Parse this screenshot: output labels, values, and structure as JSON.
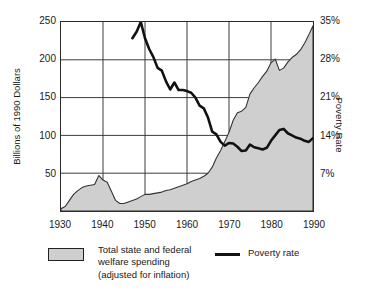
{
  "figure": {
    "cropped_header_remnant": "",
    "left_axis_title": "Billions of 1990 Dollars",
    "right_axis_title": "Poverty Rate"
  },
  "legend": {
    "area_label": "Total state and federal\nwelfare spending\n(adjusted for inflation)",
    "line_label": "Poverty rate",
    "area_color": "#cfcfcf",
    "line_color": "#111111"
  },
  "chart_data": {
    "type": "area",
    "title": "",
    "xlabel": "",
    "ylabel": "Billions of 1990 Dollars",
    "y2label": "Poverty Rate",
    "grid": true,
    "legend_position": "bottom",
    "xlim": [
      1930,
      1990
    ],
    "xticks": [
      1930,
      1940,
      1950,
      1960,
      1970,
      1980,
      1990
    ],
    "xticklabels": [
      "1930",
      "1940",
      "1950",
      "1960",
      "1970",
      "1980",
      "1990"
    ],
    "ylim": [
      0,
      250
    ],
    "yticks": [
      50,
      100,
      150,
      200,
      250
    ],
    "yticklabels": [
      "50",
      "100",
      "150",
      "200",
      "250"
    ],
    "y2lim": [
      0,
      35
    ],
    "y2ticks": [
      7,
      14,
      21,
      28,
      35
    ],
    "y2ticklabels": [
      "7%",
      "14%",
      "21%",
      "28%",
      "35%"
    ],
    "series": [
      {
        "name": "Total state and federal welfare spending (adjusted for inflation)",
        "type": "area",
        "axis": "left",
        "units": "Billions of 1990 Dollars",
        "color": "#cfcfcf",
        "x": [
          1930,
          1931,
          1932,
          1933,
          1934,
          1935,
          1936,
          1937,
          1938,
          1939,
          1940,
          1941,
          1942,
          1943,
          1944,
          1945,
          1946,
          1947,
          1948,
          1949,
          1950,
          1951,
          1952,
          1953,
          1954,
          1955,
          1956,
          1957,
          1958,
          1959,
          1960,
          1961,
          1962,
          1963,
          1964,
          1965,
          1966,
          1967,
          1968,
          1969,
          1970,
          1971,
          1972,
          1973,
          1974,
          1975,
          1976,
          1977,
          1978,
          1979,
          1980,
          1981,
          1982,
          1983,
          1984,
          1985,
          1986,
          1987,
          1988,
          1989,
          1990
        ],
        "y": [
          3,
          6,
          14,
          22,
          27,
          31,
          33,
          34,
          35,
          47,
          41,
          38,
          26,
          14,
          10,
          10,
          12,
          14,
          16,
          19,
          22,
          22,
          23,
          24,
          25,
          27,
          28,
          30,
          32,
          34,
          36,
          39,
          41,
          43,
          46,
          50,
          58,
          70,
          80,
          92,
          104,
          120,
          130,
          132,
          137,
          155,
          163,
          170,
          178,
          185,
          196,
          201,
          186,
          189,
          197,
          203,
          207,
          213,
          222,
          233,
          245
        ]
      },
      {
        "name": "Poverty rate",
        "type": "line",
        "axis": "right",
        "units": "percent",
        "color": "#111111",
        "x": [
          1947,
          1948,
          1949,
          1950,
          1951,
          1952,
          1953,
          1954,
          1955,
          1956,
          1957,
          1958,
          1959,
          1960,
          1961,
          1962,
          1963,
          1964,
          1965,
          1966,
          1967,
          1968,
          1969,
          1970,
          1971,
          1972,
          1973,
          1974,
          1975,
          1976,
          1977,
          1978,
          1979,
          1980,
          1981,
          1982,
          1983,
          1984,
          1985,
          1986,
          1987,
          1988,
          1989,
          1990
        ],
        "y": [
          32.0,
          33.2,
          35.0,
          32.0,
          30.0,
          28.5,
          26.5,
          26.0,
          24.0,
          22.5,
          23.8,
          22.4,
          22.4,
          22.2,
          21.9,
          21.0,
          19.5,
          19.0,
          17.3,
          14.7,
          14.2,
          12.8,
          12.1,
          12.6,
          12.5,
          11.9,
          11.1,
          11.2,
          12.3,
          11.8,
          11.6,
          11.4,
          11.7,
          13.0,
          14.0,
          15.0,
          15.2,
          14.4,
          14.0,
          13.6,
          13.4,
          13.0,
          12.8,
          13.5
        ]
      }
    ]
  }
}
